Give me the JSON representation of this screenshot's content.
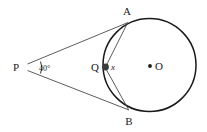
{
  "figure": {
    "type": "circle-geometry-diagram",
    "background_color": "#ffffff",
    "stroke_color": "#1a1a1a",
    "labels": {
      "external_point": "P",
      "tangent_point_top": "A",
      "tangent_point_bottom": "B",
      "circle_point": "Q",
      "center": "O",
      "angle_at_p": "40°",
      "unknown_angle": "x"
    },
    "geometry": {
      "circle": {
        "cx": 149.5,
        "cy": 65,
        "r": 46.5
      },
      "point_p": {
        "x": 26,
        "y": 67
      },
      "point_a": {
        "x": 127,
        "y": 22
      },
      "point_b": {
        "x": 128,
        "y": 110
      },
      "point_q": {
        "x": 105,
        "y": 67
      },
      "point_o": {
        "x": 149.5,
        "y": 65
      },
      "angle_arc_radius": 13
    },
    "segments": [
      {
        "name": "tangent-pa",
        "from": "P",
        "to": "A"
      },
      {
        "name": "tangent-pb",
        "from": "P",
        "to": "B"
      },
      {
        "name": "chord-qa",
        "from": "Q",
        "to": "A"
      },
      {
        "name": "chord-qb",
        "from": "Q",
        "to": "B"
      }
    ]
  }
}
